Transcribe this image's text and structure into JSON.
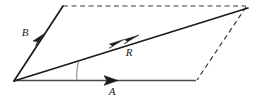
{
  "figure": {
    "type": "vector-parallelogram-diagram",
    "title": "",
    "background_color": "#ffffff",
    "width": 258,
    "height": 101
  },
  "colors": {
    "solid_stroke": "#1a1a1a",
    "dashed_stroke": "#3a3a3a",
    "arc_stroke": "#8a8a8a",
    "baseline_stroke": "#4a4a4a",
    "label_color": "#1a1a1a"
  },
  "geometry": {
    "origin": {
      "x": 14,
      "y": 81
    },
    "b_tip": {
      "x": 63,
      "y": 6
    },
    "a_tip": {
      "x": 196,
      "y": 80
    },
    "r_tip": {
      "x": 248,
      "y": 8
    },
    "top_dash_start": {
      "x": 63,
      "y": 6
    },
    "top_dash_end": {
      "x": 246,
      "y": 6
    },
    "right_dash_start": {
      "x": 246,
      "y": 7
    },
    "right_dash_end": {
      "x": 197,
      "y": 80
    }
  },
  "vectors": [
    {
      "name": "B",
      "label": "B",
      "label_x": 25,
      "label_y": 36,
      "arrowhead_count": 1,
      "arrowhead_x": 41,
      "arrowhead_y": 39,
      "style": "solid",
      "description": "vector B from origin toward upper left corner"
    },
    {
      "name": "R",
      "label": "R",
      "label_x": 129,
      "label_y": 56,
      "arrowhead_count": 2,
      "arrowhead_x": 120,
      "arrowhead_y": 43,
      "arrowhead2_x": 134,
      "arrowhead2_y": 40,
      "style": "solid",
      "description": "resultant vector R from origin to opposite corner, double arrowhead"
    },
    {
      "name": "A",
      "label": "A",
      "label_x": 112,
      "label_y": 95,
      "arrowhead_count": 1,
      "arrowhead_x": 112,
      "arrowhead_y": 79,
      "style": "solid",
      "description": "vector A along the horizontal baseline"
    }
  ],
  "angle_arc": {
    "name": "angle-between-A-and-R",
    "from": {
      "x": 78,
      "y": 61
    },
    "to": {
      "x": 77,
      "y": 80
    },
    "label": ""
  },
  "dashed_edges": [
    {
      "name": "top-dashed-edge"
    },
    {
      "name": "right-dashed-edge"
    }
  ]
}
